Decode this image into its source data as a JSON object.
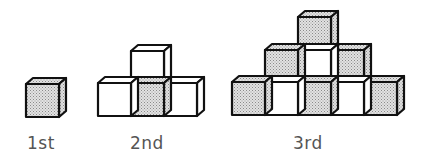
{
  "diagram": {
    "colors": {
      "shaded": "#cfcfcf",
      "plain": "#ffffff",
      "stroke": "#111111",
      "label": "#555555"
    },
    "cube": {
      "size": 33,
      "depth_dx": 7,
      "depth_dy": 6
    },
    "figures": [
      {
        "label": "1st",
        "label_x": 27,
        "cubes": [
          {
            "x": 26,
            "y": 84,
            "shade": "shaded"
          }
        ]
      },
      {
        "label": "2nd",
        "label_x": 130,
        "cubes": [
          {
            "x": 131,
            "y": 51,
            "shade": "plain"
          },
          {
            "x": 98,
            "y": 83,
            "shade": "plain"
          },
          {
            "x": 131,
            "y": 83,
            "shade": "shaded"
          },
          {
            "x": 164,
            "y": 83,
            "shade": "plain"
          }
        ]
      },
      {
        "label": "3rd",
        "label_x": 293,
        "cubes": [
          {
            "x": 298,
            "y": 17,
            "shade": "shaded"
          },
          {
            "x": 265,
            "y": 50,
            "shade": "shaded"
          },
          {
            "x": 298,
            "y": 50,
            "shade": "plain"
          },
          {
            "x": 331,
            "y": 50,
            "shade": "shaded"
          },
          {
            "x": 232,
            "y": 82,
            "shade": "shaded"
          },
          {
            "x": 265,
            "y": 82,
            "shade": "plain"
          },
          {
            "x": 298,
            "y": 82,
            "shade": "shaded"
          },
          {
            "x": 331,
            "y": 82,
            "shade": "plain"
          },
          {
            "x": 364,
            "y": 82,
            "shade": "shaded"
          }
        ]
      }
    ],
    "label_y": 149
  }
}
